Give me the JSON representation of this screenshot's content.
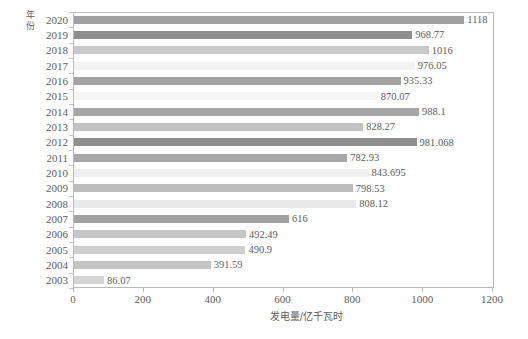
{
  "chart_data": {
    "type": "bar",
    "orientation": "horizontal",
    "title": "",
    "xlabel": "发电量/亿千瓦时",
    "ylabel": "年份",
    "xlim": [
      0,
      1200
    ],
    "xticks": [
      0,
      200,
      400,
      600,
      800,
      1000,
      1200
    ],
    "grid": false,
    "legend": null,
    "categories": [
      "2020",
      "2019",
      "2018",
      "2017",
      "2016",
      "2015",
      "2014",
      "2013",
      "2012",
      "2011",
      "2010",
      "2009",
      "2008",
      "2007",
      "2006",
      "2005",
      "2004",
      "2003"
    ],
    "values": [
      1118,
      968.77,
      1016,
      976.05,
      935.33,
      870.07,
      988.1,
      828.27,
      981.068,
      782.93,
      843.695,
      798.53,
      808.12,
      616,
      492.49,
      490.9,
      391.59,
      86.07
    ],
    "value_labels": [
      "1118",
      "968.77",
      "1016",
      "976.05",
      "935.33",
      "870.07",
      "988.1",
      "828.27",
      "981.068",
      "782.93",
      "843.695",
      "798.53",
      "808.12",
      "616",
      "492.49",
      "490.9",
      "391.59",
      "86.07"
    ],
    "bar_colors": [
      "#a0a0a0",
      "#8d8d8d",
      "#c9c9c9",
      "#f3f3f3",
      "#a3a3a3",
      "#f6f6f6",
      "#a6a6a6",
      "#c2c2c2",
      "#8f8f8f",
      "#a8a8a8",
      "#efefef",
      "#bdbdbd",
      "#e9e9e9",
      "#a1a1a1",
      "#c6c6c6",
      "#cfcfcf",
      "#c4c4c4",
      "#d4d4d4"
    ],
    "axis_color": "#b9b9b9",
    "text_color": "#5e5e5e",
    "background_color": "#ffffff"
  }
}
